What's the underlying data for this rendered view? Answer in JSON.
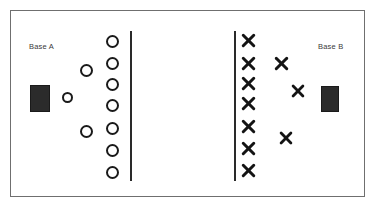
{
  "diagram": {
    "frame": {
      "x": 10,
      "y": 10,
      "width": 355,
      "height": 187,
      "stroke": "#6f6f6f"
    },
    "labels": [
      {
        "name": "base-a-label",
        "text": "Base A",
        "x": 29,
        "y": 42
      },
      {
        "name": "base-b-label",
        "text": "Base B",
        "x": 318,
        "y": 42
      }
    ],
    "bases": [
      {
        "name": "base-a-rectangle",
        "x": 30,
        "y": 85,
        "width": 20,
        "height": 27,
        "color": "#2b2b2b"
      },
      {
        "name": "base-b-rectangle",
        "x": 321,
        "y": 86,
        "width": 18,
        "height": 26,
        "color": "#2b2b2b"
      }
    ],
    "dividers": [
      {
        "name": "left-divider-line",
        "x": 130,
        "y": 31,
        "height": 150,
        "color": "#2a2a2a"
      },
      {
        "name": "right-divider-line",
        "x": 234,
        "y": 31,
        "height": 150,
        "color": "#2a2a2a"
      }
    ],
    "circles": [
      {
        "name": "circle-column-1",
        "x": 106,
        "y": 35,
        "size": 13
      },
      {
        "name": "circle-column-2",
        "x": 106,
        "y": 57,
        "size": 13
      },
      {
        "name": "circle-column-3",
        "x": 106,
        "y": 78,
        "size": 13
      },
      {
        "name": "circle-column-4",
        "x": 106,
        "y": 99,
        "size": 13
      },
      {
        "name": "circle-column-5",
        "x": 106,
        "y": 122,
        "size": 13
      },
      {
        "name": "circle-column-6",
        "x": 106,
        "y": 144,
        "size": 13
      },
      {
        "name": "circle-column-7",
        "x": 106,
        "y": 166,
        "size": 13
      },
      {
        "name": "circle-scatter-1",
        "x": 80,
        "y": 64,
        "size": 13
      },
      {
        "name": "circle-scatter-2",
        "x": 62,
        "y": 92,
        "size": 11
      },
      {
        "name": "circle-scatter-3",
        "x": 80,
        "y": 125,
        "size": 13
      }
    ],
    "crosses": [
      {
        "name": "cross-column-1",
        "x": 241,
        "y": 33,
        "size": 15
      },
      {
        "name": "cross-column-2",
        "x": 241,
        "y": 56,
        "size": 15
      },
      {
        "name": "cross-column-3",
        "x": 241,
        "y": 76,
        "size": 15
      },
      {
        "name": "cross-column-4",
        "x": 241,
        "y": 96,
        "size": 15
      },
      {
        "name": "cross-column-5",
        "x": 241,
        "y": 119,
        "size": 15
      },
      {
        "name": "cross-column-6",
        "x": 241,
        "y": 141,
        "size": 15
      },
      {
        "name": "cross-column-7",
        "x": 241,
        "y": 163,
        "size": 15
      },
      {
        "name": "cross-scatter-1",
        "x": 274,
        "y": 56,
        "size": 15
      },
      {
        "name": "cross-scatter-2",
        "x": 291,
        "y": 84,
        "size": 14
      },
      {
        "name": "cross-scatter-3",
        "x": 279,
        "y": 131,
        "size": 14
      }
    ]
  }
}
